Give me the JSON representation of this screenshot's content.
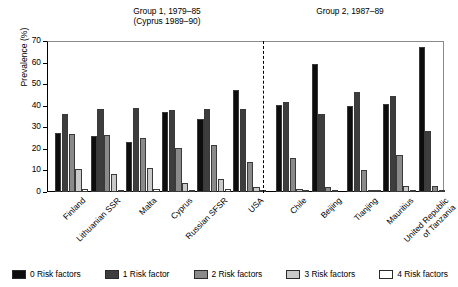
{
  "titles": {
    "group1": "Group 1, 1979–85\n(Cyprus 1989–90)",
    "group2": "Group 2, 1987–89"
  },
  "axes": {
    "ylabel": "Prevalence (%)",
    "yticks": [
      "0",
      "10",
      "20",
      "30",
      "40",
      "50",
      "60",
      "70"
    ]
  },
  "legend": {
    "items": [
      {
        "label": "0 Risk factors",
        "color": "#0d0d0d"
      },
      {
        "label": "1 Risk factor",
        "color": "#3d3d3d"
      },
      {
        "label": "2 Risk factors",
        "color": "#8a8a8a"
      },
      {
        "label": "3 Risk factors",
        "color": "#c9c9c9"
      },
      {
        "label": "4 Risk factors",
        "color": "#ffffff"
      }
    ]
  },
  "chart_data": {
    "type": "bar",
    "xlabel": "",
    "ylabel": "Prevalence (%)",
    "ylim": [
      0,
      70
    ],
    "ytick_step": 10,
    "grid": false,
    "legend_position": "bottom",
    "categories": [
      "Finland",
      "Lithuanian SSR",
      "Malta",
      "Cyprus",
      "Russian SFSR",
      "USA",
      "Chile",
      "Beijing",
      "Tianjing",
      "Mauritius",
      "United Republic\nof Tanzania"
    ],
    "groups": [
      {
        "name": "Group 1, 1979–85 (Cyprus 1989–90)",
        "categories": [
          "Finland",
          "Lithuanian SSR",
          "Malta",
          "Cyprus",
          "Russian SFSR",
          "USA"
        ]
      },
      {
        "name": "Group 2, 1987–89",
        "categories": [
          "Chile",
          "Beijing",
          "Tianjing",
          "Mauritius",
          "United Republic of Tanzania"
        ]
      }
    ],
    "series": [
      {
        "name": "0 Risk factors",
        "color": "#0d0d0d",
        "values": [
          27.5,
          26.0,
          23.0,
          37.0,
          34.0,
          47.5,
          40.5,
          59.5,
          40.0,
          41.0,
          67.0
        ]
      },
      {
        "name": "1 Risk factor",
        "color": "#3d3d3d",
        "values": [
          36.0,
          38.5,
          39.0,
          38.0,
          38.5,
          38.5,
          41.5,
          36.0,
          46.5,
          44.5,
          28.5
        ]
      },
      {
        "name": "2 Risk factors",
        "color": "#8a8a8a",
        "values": [
          27.0,
          26.5,
          25.0,
          20.5,
          22.0,
          14.0,
          16.0,
          2.5,
          10.0,
          17.0,
          3.0
        ]
      },
      {
        "name": "3 Risk factors",
        "color": "#c9c9c9",
        "values": [
          10.5,
          8.5,
          11.0,
          4.0,
          6.0,
          2.5,
          1.2,
          0.3,
          0.6,
          3.0,
          0.4
        ]
      },
      {
        "name": "4 Risk factors",
        "color": "#ffffff",
        "values": [
          1.2,
          0.8,
          1.5,
          0.8,
          1.5,
          0.5,
          0.3,
          0.0,
          0.2,
          0.4,
          0.0
        ]
      }
    ]
  }
}
